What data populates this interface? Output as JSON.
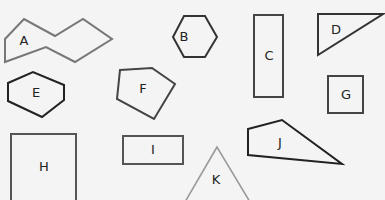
{
  "diagram": {
    "background": "#f4f4f4",
    "shapes": [
      {
        "id": "A",
        "label": "A",
        "type": "irregular-octagon",
        "points": "5,39 24,19 55,36 83,19 112,39 75,62 46,47 5,62",
        "label_pos": [
          24,
          41
        ],
        "stroke": "#777777"
      },
      {
        "id": "B",
        "label": "B",
        "type": "hexagon",
        "points": "184,16 205,16 217,37 205,57 184,57 173,37",
        "label_pos": [
          184,
          37
        ],
        "stroke": "#333333"
      },
      {
        "id": "C",
        "label": "C",
        "type": "rectangle",
        "points": "254,15 283,15 283,97 254,97",
        "label_pos": [
          269,
          56
        ],
        "stroke": "#444444"
      },
      {
        "id": "D",
        "label": "D",
        "type": "right-triangle",
        "points": "318,14 383,14 318,55",
        "label_pos": [
          336,
          30
        ],
        "stroke": "#333333"
      },
      {
        "id": "E",
        "label": "E",
        "type": "hexagon-irregular",
        "points": "8,83 33,72 64,85 64,100 42,117 8,101",
        "label_pos": [
          36,
          93
        ],
        "stroke": "#222222"
      },
      {
        "id": "F",
        "label": "F",
        "type": "pentagon-irregular",
        "points": "120,70 152,68 175,84 154,119 117,99",
        "label_pos": [
          143,
          89
        ],
        "stroke": "#444444"
      },
      {
        "id": "G",
        "label": "G",
        "type": "square",
        "points": "328,76 363,76 363,113 328,113",
        "label_pos": [
          346,
          95
        ],
        "stroke": "#444444"
      },
      {
        "id": "H",
        "label": "H",
        "type": "square",
        "points": "11,134 76,134 76,202 11,202",
        "label_pos": [
          44,
          167
        ],
        "stroke": "#555555"
      },
      {
        "id": "I",
        "label": "I",
        "type": "rectangle",
        "points": "123,136 183,136 183,164 123,164",
        "label_pos": [
          153,
          150
        ],
        "stroke": "#555555"
      },
      {
        "id": "J",
        "label": "J",
        "type": "quadrilateral",
        "points": "248,129 282,120 342,164 248,155",
        "label_pos": [
          280,
          143
        ],
        "stroke": "#222222"
      },
      {
        "id": "K",
        "label": "K",
        "type": "triangle",
        "points": "217,147 185,202 250,202",
        "label_pos": [
          216,
          180
        ],
        "stroke": "#a8a8a8"
      }
    ]
  }
}
